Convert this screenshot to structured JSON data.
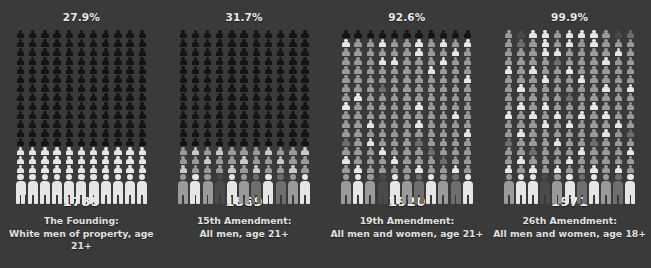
{
  "meta": {
    "background_color": "#3a3a3a",
    "text_color": "#e8e8e8",
    "grid_columns": 11,
    "small_rows": 16,
    "big_rows": 1
  },
  "palette": {
    "ineligible_dark": "#141414",
    "eligible_light": "#c9c9c9",
    "eligible_lighter": "#e6e6e6",
    "eligible_mid": "#9a9a9a",
    "eligible_dim": "#6e6e6e",
    "eligible_darkish": "#4a4a4a"
  },
  "panels": [
    {
      "id": "panel-1789",
      "percent": "27.9%",
      "percent_value": 27.9,
      "year": "1789",
      "caption_line1": "The Founding:",
      "caption_line2": "White men of property, age 21+",
      "rows": [
        [
          "d",
          "d",
          "d",
          "d",
          "d",
          "d",
          "d",
          "d",
          "d",
          "d",
          "d"
        ],
        [
          "d",
          "d",
          "d",
          "d",
          "d",
          "d",
          "d",
          "d",
          "d",
          "d",
          "d"
        ],
        [
          "d",
          "d",
          "d",
          "d",
          "d",
          "d",
          "d",
          "d",
          "d",
          "d",
          "d"
        ],
        [
          "d",
          "d",
          "d",
          "d",
          "d",
          "d",
          "d",
          "d",
          "d",
          "d",
          "d"
        ],
        [
          "d",
          "d",
          "d",
          "d",
          "d",
          "d",
          "d",
          "d",
          "d",
          "d",
          "d"
        ],
        [
          "d",
          "d",
          "d",
          "d",
          "d",
          "d",
          "d",
          "d",
          "d",
          "d",
          "d"
        ],
        [
          "d",
          "d",
          "d",
          "d",
          "d",
          "d",
          "d",
          "d",
          "d",
          "d",
          "d"
        ],
        [
          "d",
          "d",
          "d",
          "d",
          "d",
          "d",
          "d",
          "d",
          "d",
          "d",
          "d"
        ],
        [
          "d",
          "d",
          "d",
          "d",
          "d",
          "d",
          "d",
          "d",
          "d",
          "d",
          "d"
        ],
        [
          "d",
          "d",
          "d",
          "d",
          "d",
          "d",
          "d",
          "d",
          "d",
          "d",
          "d"
        ],
        [
          "d",
          "d",
          "d",
          "d",
          "d",
          "d",
          "d",
          "d",
          "d",
          "d",
          "d"
        ],
        [
          "d",
          "d",
          "d",
          "d",
          "d",
          "d",
          "d",
          "d",
          "d",
          "d",
          "d"
        ],
        [
          "d",
          "d",
          "d",
          "d",
          "d",
          "d",
          "d",
          "d",
          "d",
          "d",
          "d"
        ],
        [
          "l",
          "l",
          "l",
          "l",
          "l",
          "l",
          "l",
          "l",
          "l",
          "l",
          "l"
        ],
        [
          "l",
          "l",
          "l",
          "l",
          "l",
          "l",
          "l",
          "l",
          "l",
          "l",
          "l"
        ],
        [
          "l",
          "l",
          "l",
          "l",
          "l",
          "l",
          "l",
          "l",
          "l",
          "l",
          "l"
        ]
      ],
      "big_row": [
        "l",
        "l",
        "l",
        "l",
        "l",
        "l",
        "l",
        "l",
        "l",
        "l",
        "l"
      ]
    },
    {
      "id": "panel-1869",
      "percent": "31.7%",
      "percent_value": 31.7,
      "year": "1869",
      "caption_line1": "15th Amendment:",
      "caption_line2": "All men, age 21+",
      "rows": [
        [
          "d",
          "d",
          "d",
          "d",
          "d",
          "d",
          "d",
          "d",
          "d",
          "d",
          "d"
        ],
        [
          "d",
          "d",
          "d",
          "d",
          "d",
          "d",
          "d",
          "d",
          "d",
          "d",
          "d"
        ],
        [
          "d",
          "d",
          "d",
          "d",
          "d",
          "d",
          "d",
          "d",
          "d",
          "d",
          "d"
        ],
        [
          "d",
          "d",
          "d",
          "d",
          "d",
          "d",
          "d",
          "d",
          "d",
          "d",
          "d"
        ],
        [
          "d",
          "d",
          "d",
          "d",
          "d",
          "d",
          "d",
          "d",
          "d",
          "d",
          "d"
        ],
        [
          "d",
          "d",
          "d",
          "d",
          "d",
          "d",
          "d",
          "d",
          "d",
          "d",
          "d"
        ],
        [
          "d",
          "d",
          "d",
          "d",
          "d",
          "d",
          "d",
          "d",
          "d",
          "d",
          "d"
        ],
        [
          "d",
          "d",
          "d",
          "d",
          "d",
          "d",
          "d",
          "d",
          "d",
          "d",
          "d"
        ],
        [
          "d",
          "d",
          "d",
          "d",
          "d",
          "d",
          "d",
          "d",
          "d",
          "d",
          "d"
        ],
        [
          "d",
          "d",
          "d",
          "d",
          "d",
          "d",
          "d",
          "d",
          "d",
          "d",
          "d"
        ],
        [
          "d",
          "d",
          "d",
          "d",
          "d",
          "d",
          "d",
          "d",
          "d",
          "d",
          "d"
        ],
        [
          "d",
          "d",
          "d",
          "d",
          "d",
          "d",
          "d",
          "d",
          "d",
          "d",
          "d"
        ],
        [
          "d",
          "d",
          "d",
          "d",
          "d",
          "d",
          "d",
          "d",
          "d",
          "d",
          "d"
        ],
        [
          "m",
          "e",
          "m",
          "e",
          "m",
          "m",
          "m",
          "e",
          "m",
          "m",
          "e"
        ],
        [
          "m",
          "m",
          "e",
          "m",
          "m",
          "e",
          "m",
          "m",
          "e",
          "m",
          "m"
        ],
        [
          "e",
          "m",
          "m",
          "m",
          "e",
          "m",
          "e",
          "m",
          "m",
          "e",
          "m"
        ]
      ],
      "big_row": [
        "m",
        "l",
        "m",
        "x",
        "l",
        "m",
        "n",
        "l",
        "n",
        "m",
        "l"
      ]
    },
    {
      "id": "panel-1920",
      "percent": "92.6%",
      "percent_value": 92.6,
      "year": "1920",
      "caption_line1": "19th Amendment:",
      "caption_line2": "All men and women, age 21+",
      "rows": [
        [
          "d",
          "d",
          "d",
          "d",
          "d",
          "d",
          "d",
          "d",
          "d",
          "d",
          "d"
        ],
        [
          "l",
          "m",
          "m",
          "l",
          "m",
          "m",
          "l",
          "m",
          "l",
          "m",
          "l"
        ],
        [
          "m",
          "m",
          "m",
          "m",
          "m",
          "m",
          "l",
          "m",
          "m",
          "l",
          "m"
        ],
        [
          "m",
          "m",
          "m",
          "l",
          "l",
          "m",
          "m",
          "m",
          "l",
          "m",
          "m"
        ],
        [
          "m",
          "m",
          "m",
          "m",
          "m",
          "m",
          "m",
          "l",
          "m",
          "m",
          "m"
        ],
        [
          "m",
          "m",
          "m",
          "m",
          "m",
          "m",
          "m",
          "m",
          "m",
          "m",
          "l"
        ],
        [
          "m",
          "m",
          "m",
          "n",
          "m",
          "m",
          "m",
          "m",
          "m",
          "m",
          "m"
        ],
        [
          "m",
          "l",
          "m",
          "m",
          "m",
          "m",
          "m",
          "m",
          "m",
          "m",
          "m"
        ],
        [
          "l",
          "m",
          "m",
          "m",
          "m",
          "m",
          "l",
          "m",
          "m",
          "m",
          "m"
        ],
        [
          "m",
          "m",
          "m",
          "m",
          "m",
          "m",
          "m",
          "m",
          "m",
          "l",
          "m"
        ],
        [
          "m",
          "m",
          "l",
          "m",
          "m",
          "m",
          "l",
          "m",
          "m",
          "m",
          "m"
        ],
        [
          "m",
          "m",
          "m",
          "m",
          "m",
          "m",
          "m",
          "m",
          "m",
          "m",
          "l"
        ],
        [
          "n",
          "m",
          "l",
          "m",
          "m",
          "m",
          "n",
          "m",
          "m",
          "m",
          "m"
        ],
        [
          "m",
          "m",
          "m",
          "l",
          "m",
          "m",
          "m",
          "n",
          "m",
          "m",
          "m"
        ],
        [
          "l",
          "m",
          "m",
          "m",
          "l",
          "m",
          "m",
          "m",
          "n",
          "m",
          "m"
        ],
        [
          "m",
          "l",
          "m",
          "m",
          "m",
          "m",
          "l",
          "m",
          "m",
          "l",
          "m"
        ]
      ],
      "big_row": [
        "m",
        "l",
        "m",
        "x",
        "l",
        "m",
        "n",
        "l",
        "m",
        "n",
        "l"
      ]
    },
    {
      "id": "panel-1971",
      "percent": "99.9%",
      "percent_value": 99.9,
      "year": "1971",
      "caption_line1": "26th Amendment:",
      "caption_line2": "All men and women, age 18+",
      "rows": [
        [
          "m",
          "x",
          "l",
          "l",
          "m",
          "l",
          "l",
          "l",
          "m",
          "x",
          "n"
        ],
        [
          "m",
          "n",
          "m",
          "l",
          "m",
          "l",
          "m",
          "l",
          "m",
          "m",
          "m"
        ],
        [
          "m",
          "m",
          "m",
          "l",
          "l",
          "m",
          "m",
          "m",
          "m",
          "l",
          "m"
        ],
        [
          "m",
          "m",
          "m",
          "m",
          "n",
          "m",
          "m",
          "m",
          "l",
          "m",
          "m"
        ],
        [
          "l",
          "m",
          "l",
          "m",
          "m",
          "l",
          "m",
          "m",
          "m",
          "m",
          "m"
        ],
        [
          "m",
          "m",
          "m",
          "l",
          "m",
          "m",
          "l",
          "m",
          "m",
          "m",
          "m"
        ],
        [
          "m",
          "l",
          "m",
          "m",
          "m",
          "m",
          "m",
          "m",
          "l",
          "m",
          "l"
        ],
        [
          "m",
          "m",
          "m",
          "m",
          "m",
          "n",
          "m",
          "m",
          "m",
          "m",
          "m"
        ],
        [
          "m",
          "l",
          "m",
          "l",
          "m",
          "m",
          "m",
          "l",
          "m",
          "m",
          "m"
        ],
        [
          "l",
          "m",
          "l",
          "m",
          "l",
          "m",
          "l",
          "m",
          "l",
          "m",
          "m"
        ],
        [
          "m",
          "m",
          "m",
          "l",
          "m",
          "l",
          "m",
          "m",
          "m",
          "l",
          "m"
        ],
        [
          "m",
          "l",
          "m",
          "m",
          "m",
          "m",
          "m",
          "m",
          "l",
          "m",
          "n"
        ],
        [
          "n",
          "m",
          "m",
          "m",
          "l",
          "m",
          "m",
          "n",
          "m",
          "m",
          "m"
        ],
        [
          "m",
          "m",
          "n",
          "m",
          "m",
          "m",
          "l",
          "m",
          "m",
          "m",
          "l"
        ],
        [
          "m",
          "l",
          "m",
          "m",
          "m",
          "l",
          "m",
          "m",
          "m",
          "m",
          "m"
        ],
        [
          "l",
          "m",
          "l",
          "m",
          "l",
          "m",
          "m",
          "l",
          "m",
          "l",
          "m"
        ]
      ],
      "big_row": [
        "m",
        "l",
        "l",
        "x",
        "m",
        "l",
        "n",
        "l",
        "m",
        "n",
        "l"
      ]
    }
  ]
}
